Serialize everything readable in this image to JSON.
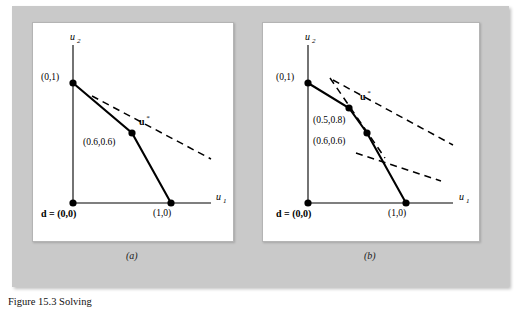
{
  "figure": {
    "caption": "Figure 15.3  Solving",
    "plate_color": "#c9c9c9",
    "panel_bg": "#ffffff"
  },
  "panel_a": {
    "caption": "(a)",
    "axis_x_label": "u",
    "axis_x_sub": "1",
    "axis_y_label": "u",
    "axis_y_sub": "2",
    "points": [
      {
        "name": "point-0-1",
        "label": "(0,1)",
        "x": 0,
        "y": 1
      },
      {
        "name": "point-1-0",
        "label": "(1,0)",
        "x": 1,
        "y": 0
      },
      {
        "name": "point-06-06",
        "label": "(0.6,0.6)",
        "x": 0.6,
        "y": 0.6
      },
      {
        "name": "disagreement-point",
        "label": "d = (0,0)",
        "x": 0,
        "y": 0
      }
    ],
    "optimum_label": "u*",
    "optimum_superscript": "*",
    "optimum_base": "u"
  },
  "panel_b": {
    "caption": "(b)",
    "axis_x_label": "u",
    "axis_x_sub": "1",
    "axis_y_label": "u",
    "axis_y_sub": "2",
    "points": [
      {
        "name": "point-0-1",
        "label": "(0,1)",
        "x": 0,
        "y": 1
      },
      {
        "name": "point-1-0",
        "label": "(1,0)",
        "x": 1,
        "y": 0
      },
      {
        "name": "point-05-08",
        "label": "(0.5,0.8)",
        "x": 0.5,
        "y": 0.8
      },
      {
        "name": "point-06-06",
        "label": "(0.6,0.6)",
        "x": 0.6,
        "y": 0.6
      },
      {
        "name": "disagreement-point",
        "label": "d = (0,0)",
        "x": 0,
        "y": 0
      }
    ],
    "optimum_label": "u*",
    "optimum_superscript": "*",
    "optimum_base": "u"
  }
}
